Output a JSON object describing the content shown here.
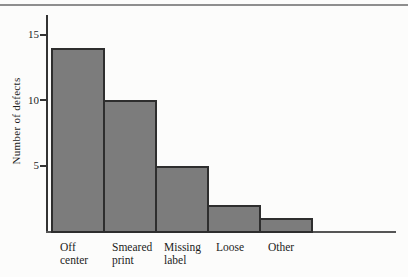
{
  "figure": {
    "background": "#fcfcfb",
    "top_rule_color": "#8e8e8e"
  },
  "chart_data": {
    "type": "bar",
    "title": "",
    "xlabel": "",
    "ylabel": "Number of defects",
    "categories": [
      "Off center",
      "Smeared print",
      "Missing label",
      "Loose",
      "Other"
    ],
    "category_lines": [
      [
        "Off",
        "center"
      ],
      [
        "Smeared",
        "print"
      ],
      [
        "Missing",
        "label"
      ],
      [
        "Loose"
      ],
      [
        "Other"
      ]
    ],
    "values": [
      14,
      10,
      5,
      2,
      1
    ],
    "yticks": [
      5,
      10,
      15
    ],
    "ylim": [
      0,
      16.5
    ],
    "grid": false,
    "legend": false,
    "bar_color": "#7c7c7c",
    "bar_border_color": "#2e2e2e",
    "axis_color": "#333333",
    "baseline_color": "#555555",
    "text_color": "#1c1c1c"
  }
}
